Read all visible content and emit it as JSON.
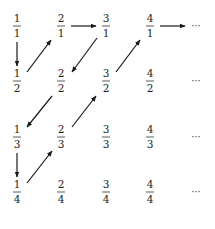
{
  "diagram": {
    "columns": [
      1,
      2,
      3,
      4
    ],
    "rows": [
      1,
      2,
      3,
      4
    ],
    "fractions": [
      {
        "num": "1",
        "den": "1",
        "col": 0,
        "row": 0
      },
      {
        "num": "2",
        "den": "1",
        "col": 1,
        "row": 0
      },
      {
        "num": "3",
        "den": "1",
        "col": 2,
        "row": 0
      },
      {
        "num": "4",
        "den": "1",
        "col": 3,
        "row": 0
      },
      {
        "num": "1",
        "den": "2",
        "col": 0,
        "row": 1
      },
      {
        "num": "2",
        "den": "2",
        "col": 1,
        "row": 1
      },
      {
        "num": "3",
        "den": "2",
        "col": 2,
        "row": 1
      },
      {
        "num": "4",
        "den": "2",
        "col": 3,
        "row": 1
      },
      {
        "num": "1",
        "den": "3",
        "col": 0,
        "row": 2
      },
      {
        "num": "2",
        "den": "3",
        "col": 1,
        "row": 2
      },
      {
        "num": "3",
        "den": "3",
        "col": 2,
        "row": 2
      },
      {
        "num": "4",
        "den": "3",
        "col": 3,
        "row": 2
      },
      {
        "num": "1",
        "den": "4",
        "col": 0,
        "row": 3
      },
      {
        "num": "2",
        "den": "4",
        "col": 1,
        "row": 3
      },
      {
        "num": "3",
        "den": "4",
        "col": 2,
        "row": 3
      },
      {
        "num": "4",
        "den": "4",
        "col": 3,
        "row": 3
      }
    ],
    "ellipsis": "···",
    "path": [
      {
        "from": "1/1",
        "to": "1/2",
        "direction": "down"
      },
      {
        "from": "1/2",
        "to": "2/1",
        "direction": "up-right"
      },
      {
        "from": "2/1",
        "to": "3/1",
        "direction": "right"
      },
      {
        "from": "3/1",
        "to": "2/2",
        "direction": "down-left"
      },
      {
        "from": "2/2",
        "to": "1/3",
        "direction": "down-left"
      },
      {
        "from": "1/3",
        "to": "1/4",
        "direction": "down"
      },
      {
        "from": "1/4",
        "to": "2/3",
        "direction": "up-right"
      },
      {
        "from": "2/3",
        "to": "3/2",
        "direction": "up-right"
      },
      {
        "from": "3/2",
        "to": "4/1",
        "direction": "up-right"
      },
      {
        "from": "4/1",
        "to": "...",
        "direction": "right"
      }
    ]
  }
}
